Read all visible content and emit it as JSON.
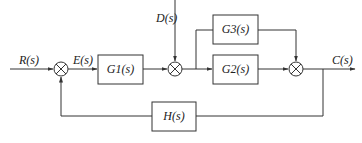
{
  "diagram": {
    "type": "control-system-block-diagram",
    "signals": {
      "input": "R(s)",
      "error": "E(s)",
      "disturbance": "D(s)",
      "output": "C(s)"
    },
    "blocks": {
      "g1": "G1(s)",
      "g2": "G2(s)",
      "g3": "G3(s)",
      "h": "H(s)"
    },
    "summing_junctions": [
      {
        "id": "sum1",
        "inputs": [
          "R(s)",
          "H(s) feedback"
        ],
        "output": "E(s)"
      },
      {
        "id": "sum2",
        "inputs": [
          "G1(s) output",
          "D(s)"
        ]
      },
      {
        "id": "sum3",
        "inputs": [
          "G2(s) output",
          "G3(s) output"
        ],
        "output": "C(s)"
      }
    ],
    "connections": [
      "R(s) -> sum1",
      "sum1 -> E(s) -> G1(s)",
      "G1(s) -> sum2",
      "D(s) -> sum2",
      "sum2 -> G2(s)",
      "sum2 -> G3(s)",
      "G2(s) -> sum3",
      "G3(s) -> sum3",
      "sum3 -> C(s)",
      "C(s) -> H(s) -> sum1"
    ]
  },
  "colors": {
    "line": "#333333",
    "background": "#ffffff"
  }
}
